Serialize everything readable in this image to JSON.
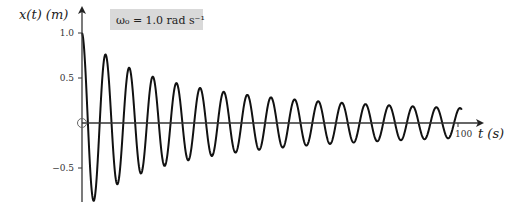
{
  "chart_data": {
    "type": "line",
    "title": "",
    "xlabel": "t (s)",
    "ylabel": "x(t) (m)",
    "annotation": "ω₀ = 1.0 rad s⁻¹",
    "xlim": [
      0,
      100
    ],
    "ylim": [
      -0.85,
      1.0
    ],
    "x_ticks": [
      {
        "value": 100,
        "label": "100"
      }
    ],
    "y_ticks": [
      {
        "value": 1.0,
        "label": "1.0"
      },
      {
        "value": 0.5,
        "label": "0.5"
      },
      {
        "value": -0.5,
        "label": "−0.5"
      }
    ],
    "origin_marker": true,
    "grid": false,
    "legend": null,
    "function": "x(t) = cos(ω₀ t) / (1 + 0.05 t)",
    "omega0": 1.0,
    "decay_k": 0.05,
    "t_end": 101,
    "series": [
      {
        "name": "x(t)",
        "extrema": [
          {
            "t": 0.0,
            "x": 1.0
          },
          {
            "t": 3.14,
            "x": -0.84
          },
          {
            "t": 6.28,
            "x": 0.75
          },
          {
            "t": 9.42,
            "x": -0.64
          },
          {
            "t": 12.57,
            "x": 0.61
          },
          {
            "t": 15.71,
            "x": -0.53
          },
          {
            "t": 18.85,
            "x": 0.5
          },
          {
            "t": 21.99,
            "x": -0.45
          },
          {
            "t": 25.13,
            "x": 0.43
          },
          {
            "t": 28.27,
            "x": -0.39
          },
          {
            "t": 31.42,
            "x": 0.38
          },
          {
            "t": 37.7,
            "x": 0.33
          },
          {
            "t": 43.98,
            "x": 0.3
          },
          {
            "t": 50.27,
            "x": 0.27
          },
          {
            "t": 56.55,
            "x": 0.24
          },
          {
            "t": 62.83,
            "x": 0.23
          },
          {
            "t": 69.12,
            "x": 0.21
          },
          {
            "t": 75.4,
            "x": 0.2
          },
          {
            "t": 81.68,
            "x": 0.19
          },
          {
            "t": 87.96,
            "x": 0.18
          },
          {
            "t": 94.25,
            "x": 0.17
          }
        ]
      }
    ]
  },
  "layout": {
    "origin_px": [
      82,
      123
    ],
    "px_per_second": 3.76,
    "px_per_unit": 90,
    "line_color": "#111111",
    "axis_color": "#333333",
    "annotation_bg": "#d9d9d9"
  }
}
